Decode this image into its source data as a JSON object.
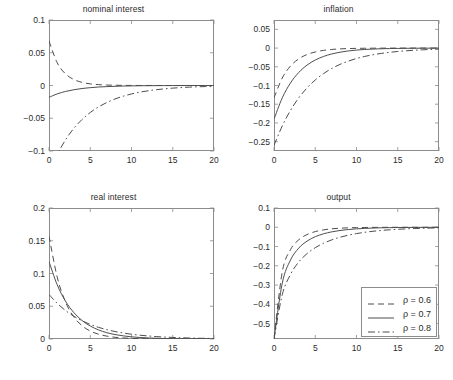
{
  "figure": {
    "width": 453,
    "height": 380,
    "background": "#ffffff",
    "axis_color": "#8c8c8c",
    "text_color": "#2b2b2b",
    "line_color": "#4d4d4d"
  },
  "legend": {
    "position": "bottom-right-inside-output-panel",
    "entries": [
      {
        "label": "ρ = 0.6",
        "style": "dashed"
      },
      {
        "label": "ρ = 0.7",
        "style": "solid"
      },
      {
        "label": "ρ = 0.8",
        "style": "dashdot"
      }
    ]
  },
  "chart_data": [
    {
      "type": "line",
      "title": "nominal interest",
      "xlabel": "",
      "ylabel": "",
      "xlim": [
        0,
        20
      ],
      "ylim": [
        -0.1,
        0.1
      ],
      "xticks": [
        0,
        5,
        10,
        15,
        20
      ],
      "yticks": [
        0.1,
        0.05,
        0,
        -0.05,
        -0.1
      ],
      "ytick_labels": [
        "0.1",
        "0.05",
        "0",
        "−0.05",
        "−0.1"
      ],
      "xtick_labels": [
        "0",
        "5",
        "10",
        "15",
        "20"
      ],
      "grid": false,
      "x": [
        0,
        1,
        2,
        3,
        4,
        5,
        6,
        7,
        8,
        9,
        10,
        11,
        12,
        13,
        14,
        15,
        16,
        17,
        18,
        19,
        20
      ],
      "series": [
        {
          "name": "ρ = 0.6",
          "style": "dashed",
          "values": [
            0.068,
            0.0345,
            0.0178,
            0.0092,
            0.0048,
            0.0025,
            0.0013,
            0.0007,
            0.0004,
            0.0002,
            0.0001,
            5e-05,
            3e-05,
            2e-05,
            1e-05,
            1e-05,
            0,
            0,
            0,
            0,
            0
          ]
        },
        {
          "name": "ρ = 0.7",
          "style": "solid",
          "values": [
            -0.018,
            -0.0128,
            -0.0091,
            -0.0065,
            -0.0046,
            -0.0033,
            -0.0023,
            -0.0017,
            -0.0012,
            -0.0008,
            -0.0006,
            -0.0004,
            -0.0003,
            -0.0002,
            -0.00015,
            -0.0001,
            -7e-05,
            -5e-05,
            -4e-05,
            -3e-05,
            -2e-05
          ]
        },
        {
          "name": "ρ = 0.8",
          "style": "dashdot",
          "values": [
            -0.136,
            -0.1055,
            -0.083,
            -0.0655,
            -0.052,
            -0.0412,
            -0.0327,
            -0.026,
            -0.0206,
            -0.0163,
            -0.0129,
            -0.0102,
            -0.0081,
            -0.0064,
            -0.0051,
            -0.004,
            -0.0032,
            -0.0025,
            -0.002,
            -0.0016,
            -0.0013
          ]
        }
      ]
    },
    {
      "type": "line",
      "title": "inflation",
      "xlabel": "",
      "ylabel": "",
      "xlim": [
        0,
        20
      ],
      "ylim": [
        -0.275,
        0.075
      ],
      "xticks": [
        0,
        5,
        10,
        15,
        20
      ],
      "yticks": [
        0.05,
        0,
        -0.05,
        -0.1,
        -0.15,
        -0.2,
        -0.25
      ],
      "ytick_labels": [
        "0.05",
        "0",
        "−0.05",
        "−0.1",
        "−0.15",
        "−0.2",
        "−0.25"
      ],
      "xtick_labels": [
        "0",
        "5",
        "10",
        "15",
        "20"
      ],
      "grid": false,
      "x": [
        0,
        1,
        2,
        3,
        4,
        5,
        6,
        7,
        8,
        9,
        10,
        11,
        12,
        13,
        14,
        15,
        16,
        17,
        18,
        19,
        20
      ],
      "series": [
        {
          "name": "ρ = 0.6",
          "style": "dashed",
          "values": [
            -0.133,
            -0.08,
            -0.048,
            -0.0288,
            -0.0173,
            -0.0104,
            -0.0062,
            -0.0037,
            -0.0022,
            -0.0013,
            -0.0008,
            -0.0005,
            -0.0003,
            -0.0002,
            -0.0001,
            -0.0001,
            -5e-05,
            -3e-05,
            -2e-05,
            -1e-05,
            -1e-05
          ]
        },
        {
          "name": "ρ = 0.7",
          "style": "solid",
          "values": [
            -0.19,
            -0.133,
            -0.0931,
            -0.0652,
            -0.0456,
            -0.0319,
            -0.0224,
            -0.0157,
            -0.011,
            -0.0077,
            -0.0054,
            -0.0037,
            -0.0026,
            -0.0018,
            -0.0013,
            -0.0009,
            -0.0006,
            -0.0004,
            -0.0003,
            -0.0002,
            -0.0002
          ]
        },
        {
          "name": "ρ = 0.8",
          "style": "dashdot",
          "values": [
            -0.26,
            -0.208,
            -0.1664,
            -0.1331,
            -0.1065,
            -0.0852,
            -0.0682,
            -0.0545,
            -0.0436,
            -0.0349,
            -0.0279,
            -0.0223,
            -0.0179,
            -0.0143,
            -0.0114,
            -0.0091,
            -0.0073,
            -0.0058,
            -0.0047,
            -0.0037,
            -0.003
          ]
        }
      ]
    },
    {
      "type": "line",
      "title": "real interest",
      "xlabel": "",
      "ylabel": "",
      "xlim": [
        0,
        20
      ],
      "ylim": [
        0,
        0.2
      ],
      "xticks": [
        0,
        5,
        10,
        15,
        20
      ],
      "yticks": [
        0.2,
        0.15,
        0.1,
        0.05,
        0
      ],
      "ytick_labels": [
        "0.2",
        "0.15",
        "0.1",
        "0.05",
        "0"
      ],
      "xtick_labels": [
        "0",
        "5",
        "10",
        "15",
        "20"
      ],
      "grid": false,
      "x": [
        0,
        1,
        2,
        3,
        4,
        5,
        6,
        7,
        8,
        9,
        10,
        11,
        12,
        13,
        14,
        15,
        16,
        17,
        18,
        19,
        20
      ],
      "series": [
        {
          "name": "ρ = 0.6",
          "style": "dashed",
          "values": [
            0.157,
            0.0942,
            0.0565,
            0.0339,
            0.0204,
            0.0122,
            0.0073,
            0.0044,
            0.0026,
            0.0016,
            0.0009,
            0.0006,
            0.0003,
            0.0002,
            0.0001,
            0.0001,
            5e-05,
            3e-05,
            2e-05,
            1e-05,
            1e-05
          ]
        },
        {
          "name": "ρ = 0.7",
          "style": "solid",
          "values": [
            0.118,
            0.0826,
            0.0578,
            0.0405,
            0.0283,
            0.0198,
            0.0139,
            0.0097,
            0.0068,
            0.0048,
            0.0033,
            0.0023,
            0.0016,
            0.0011,
            0.0008,
            0.0006,
            0.0004,
            0.0003,
            0.0002,
            0.0001,
            0.0001
          ]
        },
        {
          "name": "ρ = 0.8",
          "style": "dashdot",
          "values": [
            0.068,
            0.0544,
            0.0435,
            0.0348,
            0.0279,
            0.0223,
            0.0178,
            0.0143,
            0.0114,
            0.0091,
            0.0073,
            0.0058,
            0.0047,
            0.0037,
            0.003,
            0.0024,
            0.0019,
            0.0015,
            0.0012,
            0.001,
            0.0008
          ]
        }
      ]
    },
    {
      "type": "line",
      "title": "output",
      "xlabel": "",
      "ylabel": "",
      "xlim": [
        0,
        20
      ],
      "ylim": [
        -0.58,
        0.1
      ],
      "xticks": [
        0,
        5,
        10,
        15,
        20
      ],
      "yticks": [
        0.1,
        0,
        -0.1,
        -0.2,
        -0.3,
        -0.4,
        -0.5
      ],
      "ytick_labels": [
        "0.1",
        "0",
        "−0.1",
        "−0.2",
        "−0.3",
        "−0.4",
        "−0.5"
      ],
      "xtick_labels": [
        "0",
        "5",
        "10",
        "15",
        "20"
      ],
      "grid": false,
      "x": [
        0,
        1,
        2,
        3,
        4,
        5,
        6,
        7,
        8,
        9,
        10,
        11,
        12,
        13,
        14,
        15,
        16,
        17,
        18,
        19,
        20
      ],
      "series": [
        {
          "name": "ρ = 0.6",
          "style": "dashed",
          "values": [
            -0.58,
            -0.232,
            -0.116,
            -0.065,
            -0.038,
            -0.0225,
            -0.0135,
            -0.0081,
            -0.0049,
            -0.0029,
            -0.0018,
            -0.0011,
            -0.0006,
            -0.0004,
            -0.0002,
            -0.0001,
            -0.0001,
            -6e-05,
            -4e-05,
            -2e-05,
            -1e-05
          ]
        },
        {
          "name": "ρ = 0.7",
          "style": "solid",
          "values": [
            -0.58,
            -0.29,
            -0.17,
            -0.108,
            -0.072,
            -0.049,
            -0.034,
            -0.0238,
            -0.0167,
            -0.0117,
            -0.0082,
            -0.0057,
            -0.004,
            -0.0028,
            -0.002,
            -0.0014,
            -0.001,
            -0.0007,
            -0.0005,
            -0.0003,
            -0.0002
          ]
        },
        {
          "name": "ρ = 0.8",
          "style": "dashdot",
          "values": [
            -0.58,
            -0.35,
            -0.245,
            -0.18,
            -0.137,
            -0.106,
            -0.083,
            -0.0655,
            -0.0519,
            -0.0412,
            -0.0328,
            -0.0261,
            -0.0208,
            -0.0166,
            -0.0132,
            -0.0105,
            -0.0084,
            -0.0067,
            -0.0053,
            -0.0043,
            -0.0034
          ]
        }
      ]
    }
  ]
}
